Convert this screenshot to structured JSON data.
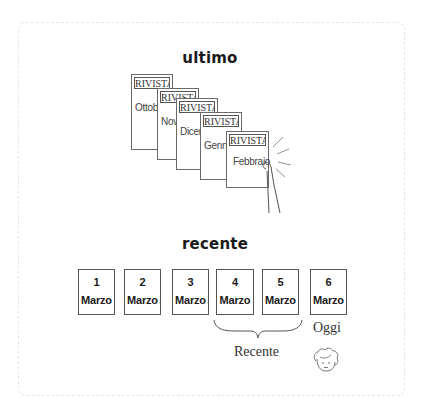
{
  "diagram": {
    "sections": {
      "ultimo": {
        "title": "ultimo",
        "magazines": [
          {
            "masthead": "RIVISTA",
            "month": "Ottob"
          },
          {
            "masthead": "RIVISTA",
            "month": "Nove"
          },
          {
            "masthead": "RIVISTA",
            "month": "Dicem"
          },
          {
            "masthead": "RIVISTA",
            "month": "Genna"
          },
          {
            "masthead": "RIVISTA",
            "month": "Febbraio"
          }
        ],
        "illustration": "hand-holding-latest-magazine"
      },
      "recente": {
        "title": "recente",
        "cards": [
          {
            "day": "1",
            "month": "Marzo"
          },
          {
            "day": "2",
            "month": "Marzo"
          },
          {
            "day": "3",
            "month": "Marzo"
          },
          {
            "day": "4",
            "month": "Marzo"
          },
          {
            "day": "5",
            "month": "Marzo"
          },
          {
            "day": "6",
            "month": "Marzo"
          }
        ],
        "brace_label": "Recente",
        "today_label": "Oggi",
        "today_icon": "person-face-icon"
      }
    },
    "colors": {
      "frame_border": "#e6e6e6",
      "line": "#555555",
      "text": "#1a1a1a"
    }
  }
}
